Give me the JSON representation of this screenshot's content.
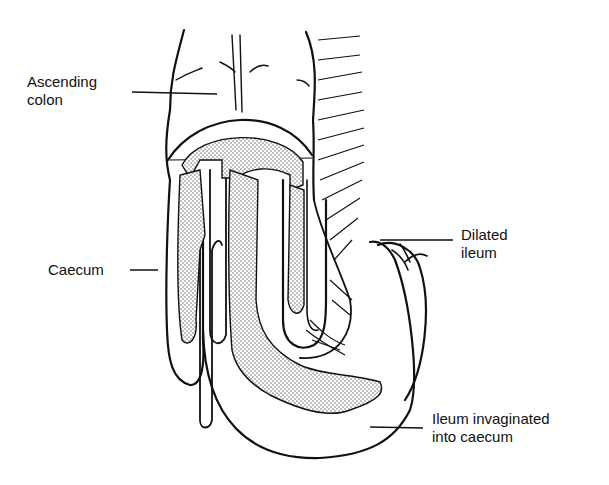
{
  "diagram": {
    "labels": [
      {
        "id": "ascending-colon",
        "line1": "Ascending",
        "line2": "colon",
        "x": 27,
        "y": 73
      },
      {
        "id": "caecum",
        "line1": "Caecum",
        "line2": "",
        "x": 48,
        "y": 260
      },
      {
        "id": "dilated-ileum",
        "line1": "Dilated",
        "line2": "ileum",
        "x": 461,
        "y": 226
      },
      {
        "id": "ileum-invaginated",
        "line1": "Ileum invaginated",
        "line2": "into caecum",
        "x": 432,
        "y": 410
      }
    ],
    "colors": {
      "ink": "#111111",
      "background": "#ffffff",
      "stipple": "#555555"
    }
  }
}
